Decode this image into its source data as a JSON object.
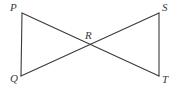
{
  "figure": {
    "type": "geometry-diagram",
    "width": 176,
    "height": 90,
    "background_color": "#ffffff",
    "stroke_color": "#3a3a3a",
    "stroke_width": 1,
    "label_color": "#3a3a3a",
    "points": {
      "P": {
        "label": "P",
        "x": 22,
        "y": 13
      },
      "Q": {
        "label": "Q",
        "x": 21,
        "y": 76
      },
      "R": {
        "label": "R",
        "x": 90,
        "y": 45
      },
      "S": {
        "label": "S",
        "x": 159,
        "y": 13
      },
      "T": {
        "label": "T",
        "x": 159,
        "y": 76
      }
    },
    "segments": [
      {
        "name": "segment-PQ",
        "from": "P",
        "to": "Q",
        "x1": 22,
        "y1": 13,
        "x2": 21,
        "y2": 76
      },
      {
        "name": "segment-ST",
        "from": "S",
        "to": "T",
        "x1": 159,
        "y1": 13,
        "x2": 159,
        "y2": 76
      },
      {
        "name": "segment-PT",
        "from": "P",
        "to": "T",
        "x1": 22,
        "y1": 13,
        "x2": 159,
        "y2": 76
      },
      {
        "name": "segment-QS",
        "from": "Q",
        "to": "S",
        "x1": 21,
        "y1": 76,
        "x2": 159,
        "y2": 13
      }
    ]
  }
}
